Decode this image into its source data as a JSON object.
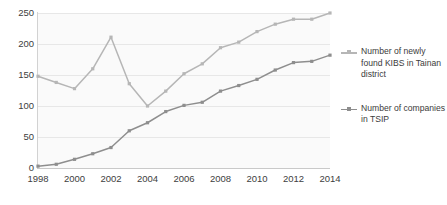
{
  "chart_data": {
    "type": "line",
    "title": "",
    "subtitle": "",
    "xlabel": "",
    "ylabel": "",
    "grid": true,
    "legend_position": "right",
    "xlim": [
      1998,
      2014
    ],
    "ylim": [
      0,
      250
    ],
    "yticks": [
      0,
      50,
      100,
      150,
      200,
      250
    ],
    "xticks": [
      1998,
      2000,
      2002,
      2004,
      2006,
      2008,
      2010,
      2012,
      2014
    ],
    "x": [
      1998,
      1999,
      2000,
      2001,
      2002,
      2003,
      2004,
      2005,
      2006,
      2007,
      2008,
      2009,
      2010,
      2011,
      2012,
      2013,
      2014
    ],
    "series": [
      {
        "name": "Number of newly found KIBS in Tainan district",
        "color": "#b6b6b6",
        "values": [
          148,
          138,
          128,
          160,
          211,
          136,
          100,
          124,
          152,
          168,
          194,
          203,
          220,
          232,
          240,
          240,
          250
        ]
      },
      {
        "name": "Number of companies in TSIP",
        "color": "#8e8e8e",
        "values": [
          3,
          6,
          14,
          23,
          33,
          60,
          73,
          91,
          101,
          106,
          124,
          133,
          143,
          158,
          170,
          172,
          182
        ]
      }
    ]
  },
  "axis": {
    "y_tick_labels": [
      "250",
      "200",
      "150",
      "100",
      "50",
      "0"
    ],
    "x_tick_labels": [
      "1998",
      "2000",
      "2002",
      "2004",
      "2006",
      "2008",
      "2010",
      "2012",
      "2014"
    ]
  },
  "legend": {
    "entries": [
      {
        "label": "Number of newly found KIBS in Tainan district",
        "color": "#b6b6b6"
      },
      {
        "label": "Number of companies in TSIP",
        "color": "#8e8e8e"
      }
    ]
  },
  "colors": {
    "plot_background": "#fafafa",
    "gridline": "#e7e7e7",
    "axis": "#c9c9c9",
    "text": "#3b3b3b",
    "series_kibs": "#b6b6b6",
    "series_tsip": "#8e8e8e"
  }
}
